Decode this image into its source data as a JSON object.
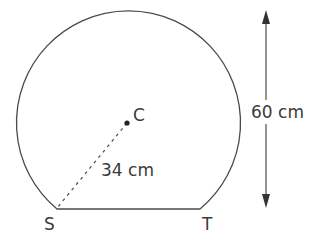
{
  "diagram": {
    "shape": "circle-segment",
    "center_label": "C",
    "radius_label": "34 cm",
    "height_label": "60 cm",
    "chord_endpoints": [
      "S",
      "T"
    ],
    "colors": {
      "stroke": "#4a4a4a",
      "text": "#3a3a3a",
      "background": "#ffffff"
    }
  }
}
